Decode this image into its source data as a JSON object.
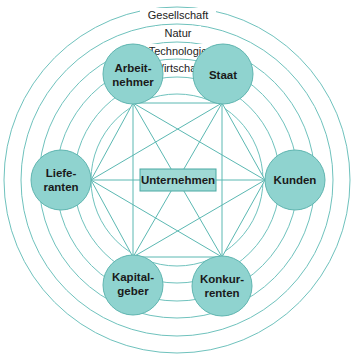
{
  "diagram": {
    "type": "stakeholder-environment",
    "center": {
      "label": "Unternehmen"
    },
    "rings": [
      {
        "label": "Gesellschaft"
      },
      {
        "label": "Natur"
      },
      {
        "label": "Technologie"
      },
      {
        "label": "Wirtschaft"
      }
    ],
    "nodes": [
      {
        "id": "arbeitnehmer",
        "line1": "Arbeit-",
        "line2": "nehmer"
      },
      {
        "id": "staat",
        "line1": "Staat",
        "line2": ""
      },
      {
        "id": "lieferanten",
        "line1": "Liefe-",
        "line2": "ranten"
      },
      {
        "id": "kunden",
        "line1": "Kunden",
        "line2": ""
      },
      {
        "id": "kapitalgeber",
        "line1": "Kapital-",
        "line2": "geber"
      },
      {
        "id": "konkurrenten",
        "line1": "Konkur-",
        "line2": "renten"
      }
    ],
    "colors": {
      "node_fill": "#8fd3cf",
      "line": "#5bb8b2",
      "text": "#1a1a1a"
    }
  }
}
